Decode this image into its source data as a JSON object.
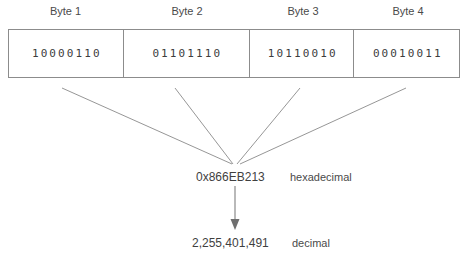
{
  "diagram": {
    "type": "byte-to-number-conversion",
    "bytes": [
      {
        "label": "Byte 1",
        "bits": "10000110"
      },
      {
        "label": "Byte 2",
        "bits": "01101110"
      },
      {
        "label": "Byte 3",
        "bits": "10110010"
      },
      {
        "label": "Byte 4",
        "bits": "00010011"
      }
    ],
    "hexadecimal": {
      "value": "0x866EB213",
      "caption": "hexadecimal"
    },
    "decimal": {
      "value": "2,255,401,491",
      "caption": "decimal"
    },
    "colors": {
      "border": "#8c8c8c",
      "text": "#444444",
      "line": "#8a8a8a",
      "background": "#ffffff"
    }
  }
}
